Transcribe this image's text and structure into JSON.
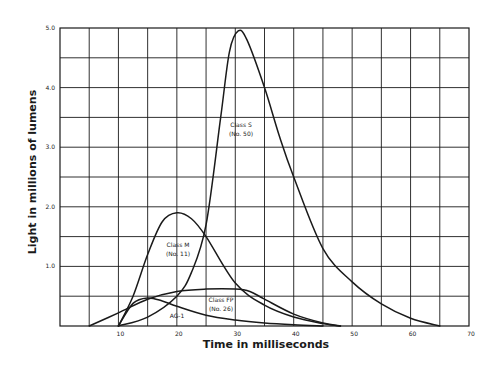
{
  "chart_data": {
    "type": "line",
    "title": "",
    "xlabel": "Time in milliseconds",
    "ylabel": "Light in millions of lumens",
    "xlim": [
      0,
      70
    ],
    "ylim": [
      0,
      5.0
    ],
    "x_ticks": [
      "10",
      "20",
      "30",
      "40",
      "50",
      "60",
      "70"
    ],
    "y_ticks": [
      "1.0",
      "2.0",
      "3.0",
      "4.0",
      "5.0"
    ],
    "grid": true,
    "grid_x_step": 5,
    "grid_y_step": 0.5,
    "legend": "none (curves labeled inline)",
    "series": [
      {
        "name": "Class S (No. 50)",
        "label_lines": [
          "Class S",
          "(No. 50)"
        ],
        "x": [
          10,
          15,
          20,
          22.5,
          25,
          27.5,
          29,
          30.5,
          32,
          35,
          37.5,
          40,
          45,
          50,
          55,
          60,
          65
        ],
        "y": [
          0,
          0.15,
          0.5,
          0.9,
          1.7,
          3.5,
          4.6,
          4.95,
          4.8,
          4.0,
          3.2,
          2.5,
          1.3,
          0.74,
          0.37,
          0.13,
          0
        ]
      },
      {
        "name": "Class M (No. 11)",
        "label_lines": [
          "Class M",
          "(No. 11)"
        ],
        "x": [
          10,
          12.5,
          15,
          17.5,
          20,
          22.5,
          25,
          30,
          35,
          40,
          45,
          48
        ],
        "y": [
          0,
          0.5,
          1.2,
          1.75,
          1.9,
          1.8,
          1.5,
          0.72,
          0.35,
          0.15,
          0.04,
          0
        ]
      },
      {
        "name": "Class FP (No. 26)",
        "label_lines": [
          "Class FP",
          "(No. 26)"
        ],
        "x": [
          5,
          10,
          15,
          20,
          25,
          30,
          32.5,
          35,
          40,
          45,
          48
        ],
        "y": [
          0,
          0.22,
          0.45,
          0.58,
          0.62,
          0.62,
          0.58,
          0.45,
          0.2,
          0.05,
          0
        ]
      },
      {
        "name": "AG-1",
        "label_lines": [
          "AG-1"
        ],
        "x": [
          10,
          12.5,
          15,
          17.5,
          20,
          25,
          30,
          35,
          40,
          45
        ],
        "y": [
          0,
          0.38,
          0.47,
          0.42,
          0.33,
          0.18,
          0.1,
          0.05,
          0.02,
          0
        ]
      }
    ]
  }
}
